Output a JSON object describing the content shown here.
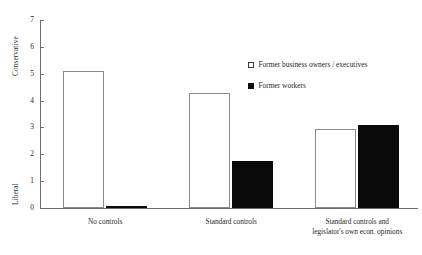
{
  "chart_data": {
    "type": "bar",
    "title": "",
    "subtitle": "",
    "xlabel": "",
    "ylabel": "",
    "ylim": [
      0,
      7
    ],
    "yticks": [
      0,
      1,
      2,
      3,
      4,
      5,
      6,
      7
    ],
    "ytick_labels": [
      "0",
      "1",
      "2",
      "3",
      "4",
      "5",
      "6",
      "7"
    ],
    "y_axis_top_label": "Conservative",
    "y_axis_bottom_label": "Liberal",
    "grid": false,
    "legend_position": "upper right",
    "categories": [
      "No controls",
      "Standard controls",
      "Standard controls and legislator's own econ. opinions"
    ],
    "category_lines": [
      [
        "No controls"
      ],
      [
        "Standard controls"
      ],
      [
        "Standard controls and",
        "legislator's own econ. opinions"
      ]
    ],
    "series": [
      {
        "name": "Former business owners / executives",
        "style": "open",
        "color": "#ffffff",
        "edge_color": "#8a8a8a",
        "values": [
          5.1,
          4.3,
          2.95
        ]
      },
      {
        "name": "Former workers",
        "style": "filled",
        "color": "#0a0a0a",
        "edge_color": "#0a0a0a",
        "values": [
          0.05,
          1.75,
          3.1
        ]
      }
    ]
  },
  "legend": {
    "items": [
      {
        "label": "Former business owners / executives",
        "marker": "open-square-icon"
      },
      {
        "label": "Former workers",
        "marker": "filled-square-icon"
      }
    ]
  },
  "colors": {
    "axis": "#6f6f6f",
    "text": "#1f1f1f",
    "bar_open_fill": "#ffffff",
    "bar_open_edge": "#8a8a8a",
    "bar_filled": "#0a0a0a",
    "background": "#ffffff"
  }
}
